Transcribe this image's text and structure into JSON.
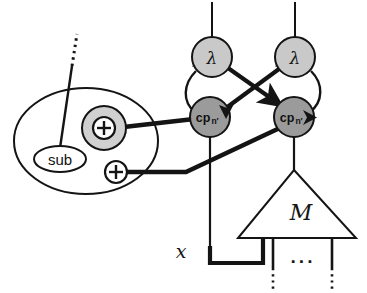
{
  "figure": {
    "background_color": "#ffffff",
    "stroke_color": "#141414"
  },
  "palette": {
    "lambda_fill": "#c9c9c9",
    "cp_fill": "#9b9b9b",
    "plus_halo_fill": "#d0d0d0",
    "white_fill": "#ffffff",
    "line": "#141414"
  },
  "nodes": {
    "lambda_left": {
      "label": "λ",
      "shape": "circle",
      "fill": "#c9c9c9",
      "cx": 212,
      "cy": 57,
      "r": 20
    },
    "lambda_right": {
      "label": "λ",
      "shape": "circle",
      "fill": "#c9c9c9",
      "cx": 295,
      "cy": 57,
      "r": 20
    },
    "cp_left": {
      "label": "cp",
      "sublabel": "n′",
      "shape": "circle",
      "fill": "#9b9b9b",
      "cx": 210,
      "cy": 117,
      "r": 20
    },
    "cp_right": {
      "label": "cp",
      "sublabel": "n′",
      "shape": "circle",
      "fill": "#9b9b9b",
      "cx": 294,
      "cy": 117,
      "r": 20
    },
    "box_ellipse": {
      "label": "",
      "shape": "ellipse",
      "fill": "#ffffff",
      "cx": 86,
      "cy": 141,
      "rx": 72,
      "ry": 53
    },
    "sub_node": {
      "label": "sub",
      "shape": "ellipse",
      "fill": "#ffffff",
      "cx": 60,
      "cy": 159,
      "rx": 26,
      "ry": 13
    },
    "plus_upper": {
      "label": "+",
      "shape": "circle",
      "fill": "#ffffff",
      "halo_fill": "#d0d0d0",
      "cx": 104,
      "cy": 128,
      "r": 11,
      "halo_r": 22
    },
    "plus_lower": {
      "label": "+",
      "shape": "circle",
      "fill": "#ffffff",
      "cx": 116,
      "cy": 172,
      "r": 11
    },
    "module_triangle": {
      "label": "M",
      "shape": "triangle",
      "fill": "#ffffff",
      "apex_x": 294,
      "apex_y": 170,
      "base_y": 238,
      "base_left_x": 238,
      "base_right_x": 356
    }
  },
  "labels": {
    "input_x": "x",
    "output_ellipsis": "···",
    "module_name": "M",
    "lambda_glyph": "λ",
    "cp_name": "cp",
    "cp_subscript": "n′",
    "sub_name": "sub",
    "plus_glyph": "+"
  },
  "edges": [
    {
      "id": "top-wire-left",
      "from": "canvas-top",
      "to": "lambda_left",
      "style": "thin-solid",
      "arrow": false
    },
    {
      "id": "top-wire-right",
      "from": "canvas-top",
      "to": "lambda_right",
      "style": "thin-solid",
      "arrow": false
    },
    {
      "id": "arc-left",
      "from": "lambda_left",
      "to": "cp_left",
      "style": "thin-arc-left",
      "arrow": false
    },
    {
      "id": "arc-right",
      "from": "lambda_right",
      "to": "cp_right",
      "style": "thin-arc-right",
      "arrow": false
    },
    {
      "id": "cross-a",
      "from": "lambda_left",
      "to": "cp_right",
      "style": "thick-solid",
      "arrow": true
    },
    {
      "id": "cross-b",
      "from": "cp_left",
      "to": "lambda_right",
      "style": "thick-solid",
      "arrow": true
    },
    {
      "id": "plus-upper-to-cp-left",
      "from": "plus_upper",
      "to": "cp_left",
      "style": "thick-solid",
      "arrow": false
    },
    {
      "id": "plus-lower-to-cp-right",
      "from": "plus_lower",
      "to": "cp_right",
      "style": "thick-solid",
      "arrow": false
    },
    {
      "id": "sub-to-dotted-top",
      "from": "sub_node",
      "to": "canvas-upper-left",
      "style": "thin-solid-to-dotted",
      "arrow": false
    },
    {
      "id": "cp-left-to-x-wire",
      "from": "cp_left",
      "to": "input_x",
      "style": "thick-elbow",
      "arrow": false
    },
    {
      "id": "cp-right-to-triangle",
      "from": "cp_right",
      "to": "module_triangle",
      "style": "thin-solid",
      "arrow": false
    },
    {
      "id": "triangle-leg-1",
      "from": "module_triangle",
      "to": "canvas-bottom",
      "style": "thin-solid-to-dotted",
      "arrow": false
    },
    {
      "id": "triangle-leg-2",
      "from": "module_triangle",
      "to": "canvas-bottom",
      "style": "thin-solid-to-dotted",
      "arrow": false
    }
  ]
}
